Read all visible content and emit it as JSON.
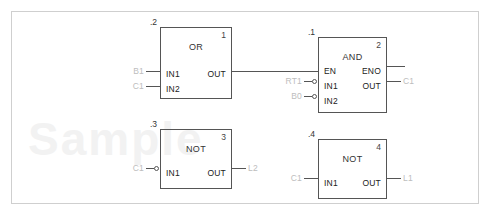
{
  "diagram": {
    "type": "function-block-diagram",
    "watermark": "Sample",
    "blocks": [
      {
        "id": "block-1",
        "tag": ".2",
        "number": "1",
        "function": "OR",
        "inputs": [
          {
            "pin": "IN1",
            "operand": "B1",
            "inverted": false
          },
          {
            "pin": "IN2",
            "operand": "C1",
            "inverted": false
          }
        ],
        "outputs": [
          {
            "pin": "OUT",
            "operand": "",
            "connected": true
          }
        ]
      },
      {
        "id": "block-2",
        "tag": ".1",
        "number": "2",
        "function": "AND",
        "inputs": [
          {
            "pin": "EN",
            "operand": "",
            "inverted": false
          },
          {
            "pin": "IN1",
            "operand": "RT1",
            "inverted": true
          },
          {
            "pin": "IN2",
            "operand": "B0",
            "inverted": true
          }
        ],
        "outputs": [
          {
            "pin": "ENO",
            "operand": "",
            "connected": true
          },
          {
            "pin": "OUT",
            "operand": "C1",
            "connected": true
          }
        ]
      },
      {
        "id": "block-3",
        "tag": ".3",
        "number": "3",
        "function": "NOT",
        "inputs": [
          {
            "pin": "IN1",
            "operand": "C1",
            "inverted": true
          }
        ],
        "outputs": [
          {
            "pin": "OUT",
            "operand": "L2",
            "connected": true
          }
        ]
      },
      {
        "id": "block-4",
        "tag": ".4",
        "number": "4",
        "function": "NOT",
        "inputs": [
          {
            "pin": "IN1",
            "operand": "C1",
            "inverted": false
          }
        ],
        "outputs": [
          {
            "pin": "OUT",
            "operand": "L1",
            "connected": true
          }
        ]
      }
    ],
    "colors": {
      "block_border": "#555555",
      "wire": "#555555",
      "pin_text": "#222222",
      "operand_text": "#bdbdbd",
      "frame": "#cfcfcf"
    }
  }
}
